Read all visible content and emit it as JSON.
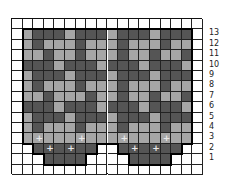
{
  "chart_title": "",
  "legend": {
    "white": "background / no stitch",
    "light": "light gray color",
    "dark": "dark gray color",
    "plus": "+ symbol stitch"
  },
  "colors": {
    "white": "#ffffff",
    "light": "#a6a6a6",
    "dark": "#555555",
    "grid": "#222222",
    "plus": "#e8e8e8"
  },
  "grid": {
    "columns": 18,
    "rows": 15,
    "row_labels": [
      "13",
      "12",
      "11",
      "10",
      "9",
      "8",
      "7",
      "6",
      "5",
      "4",
      "3",
      "2",
      "1"
    ],
    "cells": [
      "WWWWWWWWWWWWWWWWWW",
      "WLDDDLDDDLDDDLDDDW",
      "WLDLLLDLLLDLLLDLLW",
      "WLLDLLDLLLDLLDLLDW",
      "WDDDLDDDLDDDLDDDLW",
      "WLDDDLDDDLDDDLDDDW",
      "WLDLLLDLLLDLLLDLLW",
      "WLLDLLLDLLDLLDLLDW",
      "WDDDLDDDLDDDLDDDLW",
      "WLDDDLDDDLDDDLDDDW",
      "WLDLLLDLLLDLLLDLLW",
      "WLLLLLLLLLLLLLLLLW",
      "WWDDDDDDWWDDDDDDWW",
      "WWWDDDDWWWWDDDDWWW",
      "WWWWWWWWWWWWWWWWWW"
    ],
    "plus_marks": [
      {
        "row": 11,
        "col": 2
      },
      {
        "row": 11,
        "col": 6
      },
      {
        "row": 11,
        "col": 10
      },
      {
        "row": 11,
        "col": 14
      },
      {
        "row": 12,
        "col": 3
      },
      {
        "row": 12,
        "col": 5
      },
      {
        "row": 12,
        "col": 11
      },
      {
        "row": 12,
        "col": 13
      }
    ]
  }
}
